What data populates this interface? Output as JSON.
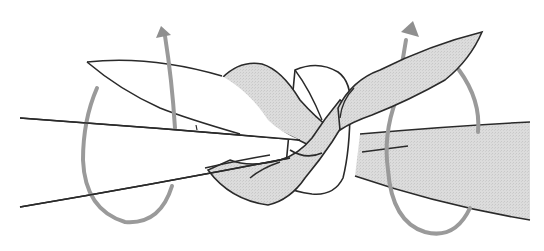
{
  "figure": {
    "colors": {
      "outline": "#2a2a2a",
      "fabric_fill": "#d9d9d9",
      "fabric_white": "#ffffff",
      "arrow": "#9a9a9a",
      "background": "#ffffff"
    },
    "elements": [
      {
        "name": "left-tail",
        "description": "two lines forming the left fabric end extending to the left"
      },
      {
        "name": "left-flap",
        "description": "white leaf-shaped flap pointing up-left"
      },
      {
        "name": "center-knot",
        "description": "interlocked grey and white fabric loops"
      },
      {
        "name": "right-tail",
        "description": "wide grey fabric end extending to the right"
      },
      {
        "name": "right-flap",
        "description": "grey leaf-shaped flap pointing up-right"
      },
      {
        "name": "left-loop-arrow",
        "description": "grey arrow looping around the left tail and pointing up"
      },
      {
        "name": "right-loop-arrow",
        "description": "grey arrow looping around the right tail and pointing up"
      }
    ]
  }
}
